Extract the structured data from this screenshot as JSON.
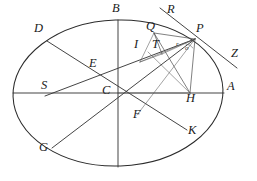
{
  "figure": {
    "type": "geometry-diagram",
    "width": 257,
    "height": 181,
    "background_color": "#ffffff",
    "stroke_color": "#2b2b2b",
    "ellipse": {
      "center": {
        "x": 118,
        "y": 93
      },
      "semi_major_x": 105,
      "semi_minor_y": 73,
      "rotation_deg": -2
    },
    "points": [
      {
        "id": "A",
        "label": "A",
        "x": 224,
        "y": 93,
        "label_x": 227,
        "label_y": 85
      },
      {
        "id": "B",
        "label": "B",
        "x": 118,
        "y": 20,
        "label_x": 113,
        "label_y": 6
      },
      {
        "id": "C",
        "label": "C",
        "x": 118,
        "y": 93,
        "label_x": 103,
        "label_y": 87
      },
      {
        "id": "D",
        "label": "D",
        "x": 47,
        "y": 41,
        "label_x": 36,
        "label_y": 25
      },
      {
        "id": "E",
        "label": "E",
        "x": 84,
        "y": 70,
        "label_x": 91,
        "label_y": 62
      },
      {
        "id": "F",
        "label": "F",
        "x": 137,
        "y": 115,
        "label_x": 135,
        "label_y": 110
      },
      {
        "id": "G",
        "label": "G",
        "x": 52,
        "y": 148,
        "label_x": 41,
        "label_y": 144
      },
      {
        "id": "H",
        "label": "H",
        "x": 190,
        "y": 93,
        "label_x": 189,
        "label_y": 90
      },
      {
        "id": "I",
        "label": "I",
        "x": 141,
        "y": 51,
        "label_x": 137,
        "label_y": 40
      },
      {
        "id": "K",
        "label": "K",
        "x": 187,
        "y": 130,
        "label_x": 190,
        "label_y": 126
      },
      {
        "id": "P",
        "label": "P",
        "x": 195,
        "y": 39,
        "label_x": 197,
        "label_y": 26
      },
      {
        "id": "Q",
        "label": "Q",
        "x": 154,
        "y": 33,
        "label_x": 148,
        "label_y": 24
      },
      {
        "id": "R",
        "label": "R",
        "x": 174,
        "y": 19,
        "label_x": 169,
        "label_y": 6
      },
      {
        "id": "S",
        "label": "S",
        "x": 48,
        "y": 93,
        "label_x": 43,
        "label_y": 82
      },
      {
        "id": "T",
        "label": "T",
        "x": 160,
        "y": 51,
        "label_x": 155,
        "label_y": 41
      },
      {
        "id": "Z",
        "label": "Z",
        "x": 232,
        "y": 62,
        "label_x": 233,
        "label_y": 51
      }
    ],
    "minor_marks": [
      {
        "id": "r-mark",
        "label": "r",
        "label_x": 178,
        "label_y": 45
      },
      {
        "id": "o-mark",
        "label": "o",
        "label_x": 187,
        "label_y": 49
      }
    ],
    "segments": [
      {
        "id": "axis-SA",
        "from": "S",
        "to": "A",
        "weight": "chord"
      },
      {
        "id": "axis-BC",
        "from": "B",
        "to": "C",
        "weight": "chord"
      },
      {
        "id": "diam-DK",
        "from": "D",
        "to": "K",
        "weight": "chord"
      },
      {
        "id": "diam-GP",
        "from": "G",
        "to": "P",
        "weight": "chord"
      },
      {
        "id": "chord-EP",
        "from": "E",
        "to": "P",
        "weight": "chord"
      },
      {
        "id": "ord-PH",
        "from": "P",
        "to": "H",
        "weight": "thin"
      },
      {
        "id": "ray-CH",
        "from": "C",
        "to": "H",
        "weight": "thin"
      },
      {
        "id": "seg-QP",
        "from": "Q",
        "to": "P",
        "weight": "thin"
      },
      {
        "id": "seg-QT",
        "from": "Q",
        "to": "T",
        "weight": "thin"
      },
      {
        "id": "seg-QH",
        "from": "Q",
        "to": "H",
        "weight": "thin"
      },
      {
        "id": "seg-QF",
        "from": "Q",
        "to": "F",
        "weight": "hair"
      },
      {
        "id": "seg-TP",
        "from": "T",
        "to": "P",
        "weight": "hair"
      },
      {
        "id": "seg-IP",
        "from": "I",
        "to": "P",
        "weight": "hair"
      },
      {
        "id": "seg-TF",
        "from": "T",
        "to": "F",
        "weight": "hair"
      },
      {
        "id": "tangent-RZ",
        "from": "R",
        "to": "Z",
        "weight": "chord"
      },
      {
        "id": "line-QR",
        "from": "Q",
        "to": "R",
        "weight": "thin"
      }
    ]
  }
}
